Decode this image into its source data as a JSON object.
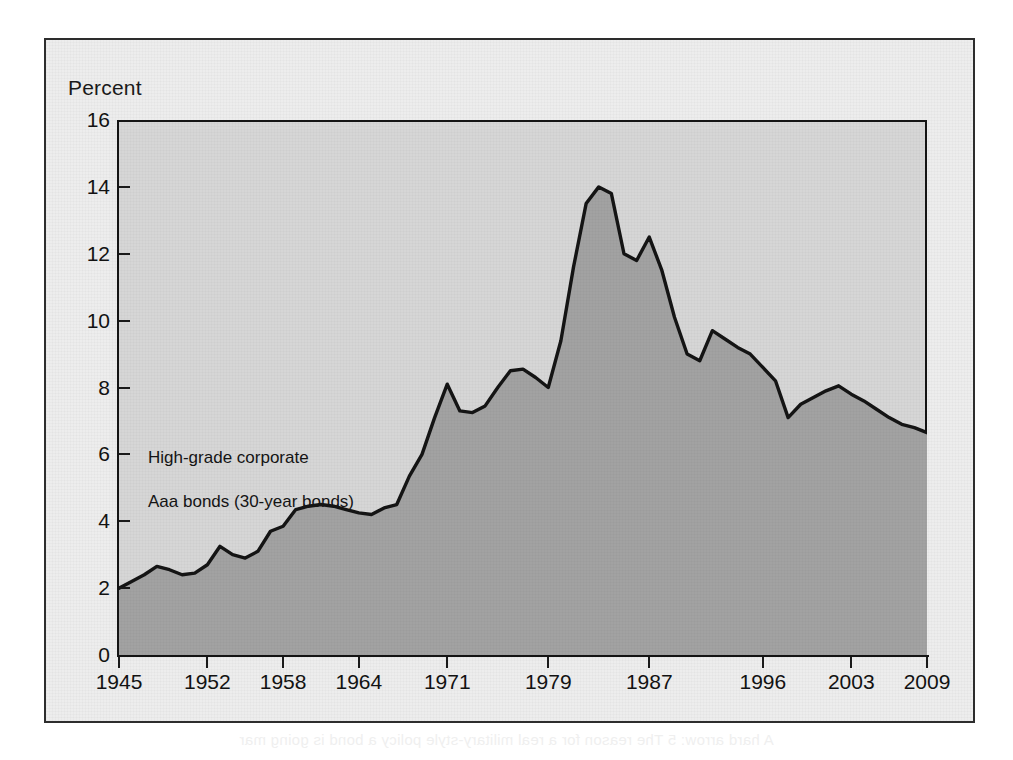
{
  "figure": {
    "y_axis_unit_label": "Percent",
    "annotation_line1": "High-grade corporate",
    "annotation_line2": "Aaa bonds (30-year bonds)",
    "ghost_text_top": "",
    "ghost_text_bottom": "A hard arrow: 5 The reason for a real military-style policy a bond is going mar"
  },
  "colors": {
    "frame_border": "#2d2d2d",
    "figure_background": "#ededed",
    "plot_background": "#d6d6d6",
    "area_fill": "#a2a2a2",
    "line_stroke": "#141414",
    "text": "#121212"
  },
  "chart_data": {
    "type": "area",
    "title": "",
    "subtitle": "",
    "xlabel": "",
    "ylabel": "Percent",
    "ylim": [
      0,
      16
    ],
    "xlim": [
      1945,
      2009
    ],
    "grid": false,
    "legend_position": "inside-left",
    "y_ticks": [
      0,
      2,
      4,
      6,
      8,
      10,
      12,
      14,
      16
    ],
    "x_ticks": [
      1945,
      1952,
      1958,
      1964,
      1971,
      1979,
      1987,
      1996,
      2003,
      2009
    ],
    "series": [
      {
        "name": "High-grade corporate Aaa bonds (30-year bonds)",
        "x": [
          1945,
          1946,
          1947,
          1948,
          1949,
          1950,
          1951,
          1952,
          1953,
          1954,
          1955,
          1956,
          1957,
          1958,
          1959,
          1960,
          1961,
          1962,
          1963,
          1964,
          1965,
          1966,
          1967,
          1968,
          1969,
          1970,
          1971,
          1972,
          1973,
          1974,
          1975,
          1976,
          1977,
          1978,
          1979,
          1980,
          1981,
          1982,
          1983,
          1984,
          1985,
          1986,
          1987,
          1988,
          1989,
          1990,
          1991,
          1992,
          1993,
          1994,
          1995,
          1996,
          1997,
          1998,
          1999,
          2000,
          2001,
          2002,
          2003,
          2004,
          2005,
          2006,
          2007,
          2008,
          2009
        ],
        "values": [
          2.0,
          2.2,
          2.4,
          2.65,
          2.55,
          2.4,
          2.45,
          2.7,
          3.25,
          3.0,
          2.9,
          3.1,
          3.7,
          3.85,
          4.35,
          4.45,
          4.5,
          4.45,
          4.35,
          4.25,
          4.2,
          4.4,
          4.5,
          5.35,
          6.0,
          7.1,
          8.1,
          7.3,
          7.25,
          7.45,
          8.0,
          8.5,
          8.55,
          8.3,
          8.0,
          9.4,
          11.6,
          13.5,
          14.0,
          13.8,
          12.0,
          11.8,
          12.5,
          11.5,
          10.1,
          9.0,
          8.8,
          9.7,
          9.45,
          9.2,
          9.0,
          8.6,
          8.2,
          7.1,
          7.5,
          7.7,
          7.9,
          8.05,
          7.8,
          7.6,
          7.35,
          7.1,
          6.9,
          6.8,
          6.65
        ],
        "peak_year": 1983,
        "peak_value": 14.0,
        "start_value": 2.0,
        "end_value": 6.1
      }
    ]
  }
}
